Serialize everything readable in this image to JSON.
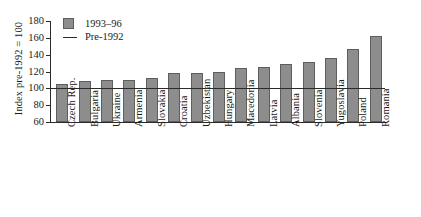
{
  "chart_data": {
    "type": "bar",
    "title": "",
    "subtitle": "",
    "xlabel": "",
    "ylabel": "Index pre-1992 = 100",
    "ylim": [
      60,
      180
    ],
    "yticks": [
      60,
      80,
      100,
      120,
      140,
      160,
      180
    ],
    "grid": false,
    "legend_position": "top-left",
    "categories": [
      "Czech Rep.",
      "Bulgaria",
      "Ukraine",
      "Armenia",
      "Slovakia",
      "Croatia",
      "Uzbekistan",
      "Hungary",
      "Macedonia",
      "Latvia",
      "Albania",
      "Slovenia",
      "Yugoslavia",
      "Poland",
      "Romania"
    ],
    "series": [
      {
        "name": "1993–96",
        "type": "bar",
        "color": "#8d8d8d",
        "values": [
          105,
          109,
          110,
          110,
          112,
          118,
          118,
          119,
          124,
          125,
          129,
          131,
          136,
          147,
          162
        ]
      },
      {
        "name": "Pre-1992",
        "type": "reference-line",
        "color": "#2b2b2b",
        "value": 100
      }
    ]
  },
  "legend": {
    "items": [
      {
        "label": "1993–96",
        "marker": "square-swatch"
      },
      {
        "label": "Pre-1992",
        "marker": "horizontal-line"
      }
    ]
  },
  "axes": {
    "y": {
      "title": "Index pre-1992 = 100",
      "tick_labels": [
        "180",
        "160",
        "140",
        "120",
        "100",
        "80",
        "60"
      ]
    }
  }
}
